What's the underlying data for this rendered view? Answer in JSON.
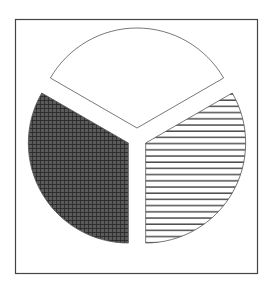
{
  "chart_data": {
    "type": "pie",
    "title": "",
    "exploded": true,
    "slices": [
      {
        "label": "",
        "value": 33.3,
        "pattern": "crosshatch-dark",
        "start_deg": 180,
        "end_deg": 300
      },
      {
        "label": "",
        "value": 33.3,
        "pattern": "none-white",
        "start_deg": 300,
        "end_deg": 420
      },
      {
        "label": "",
        "value": 33.3,
        "pattern": "horizontal-lines",
        "start_deg": 60,
        "end_deg": 180
      }
    ],
    "values": [
      33.3,
      33.3,
      33.3
    ],
    "categories": [
      "",
      "",
      ""
    ],
    "legend": null,
    "frame": true
  },
  "colors": {
    "frame": "#333333",
    "dark_fill": "#3a3a3a",
    "hatch": "#222222",
    "outline": "#555555"
  }
}
